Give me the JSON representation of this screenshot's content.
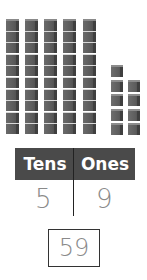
{
  "blocks": {
    "tens_rods": 5,
    "cubes_per_rod": 10,
    "ones_units": 9,
    "ones_columns": [
      5,
      4
    ]
  },
  "place_value_chart": {
    "headers": [
      "Tens",
      "Ones"
    ],
    "values": [
      "5",
      "9"
    ]
  },
  "answer": "59",
  "colors": {
    "block": "#5c5c5c",
    "header_bg": "#4a4a4a",
    "header_text": "#ffffff",
    "digit": "#8a8a8a"
  }
}
